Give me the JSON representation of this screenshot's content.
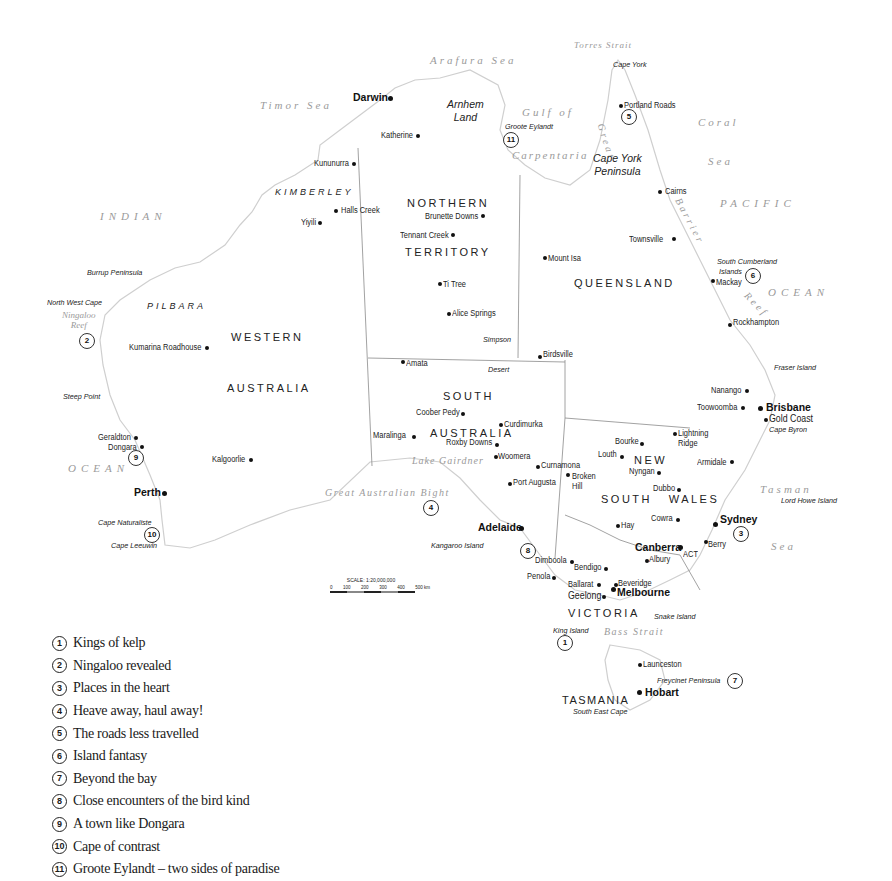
{
  "map": {
    "title": "Australia destinations map",
    "seas": [
      {
        "id": "timor-sea",
        "label": "Timor Sea",
        "x": 260,
        "y": 100
      },
      {
        "id": "arafura-sea",
        "label": "Arafura Sea",
        "x": 430,
        "y": 55
      },
      {
        "id": "torres-strait",
        "label": "Torres Strait",
        "x": 574,
        "y": 41
      },
      {
        "id": "gulf-of",
        "label": "Gulf of",
        "x": 522,
        "y": 107
      },
      {
        "id": "carpentaria",
        "label": "Carpentaria",
        "x": 512,
        "y": 150
      },
      {
        "id": "coral",
        "label": "Coral",
        "x": 698,
        "y": 117
      },
      {
        "id": "coral-sea",
        "label": "Sea",
        "x": 708,
        "y": 156
      },
      {
        "id": "pacific",
        "label": "PACIFIC",
        "x": 720,
        "y": 198
      },
      {
        "id": "ocean-east",
        "label": "OCEAN",
        "x": 768,
        "y": 287
      },
      {
        "id": "indian",
        "label": "INDIAN",
        "x": 100,
        "y": 211
      },
      {
        "id": "ocean-west",
        "label": "OCEAN",
        "x": 68,
        "y": 463
      },
      {
        "id": "great-australian-bight",
        "label": "Great Australian Bight",
        "x": 325,
        "y": 488
      },
      {
        "id": "lake-gairdner",
        "label": "Lake Gairdner",
        "x": 412,
        "y": 456
      },
      {
        "id": "tasman",
        "label": "Tasman",
        "x": 760,
        "y": 484
      },
      {
        "id": "tasman-sea",
        "label": "Sea",
        "x": 771,
        "y": 541
      },
      {
        "id": "bass-strait",
        "label": "Bass Strait",
        "x": 604,
        "y": 627
      },
      {
        "id": "ningaloo-reef",
        "label": "Ningaloo\nReef",
        "x": 62,
        "y": 311
      }
    ],
    "reef_label": {
      "great": "Great",
      "barrier": "Barrier",
      "reef": "Reef"
    },
    "states": [
      {
        "id": "northern-territory-1",
        "label": "NORTHERN",
        "x": 407,
        "y": 198
      },
      {
        "id": "northern-territory-2",
        "label": "TERRITORY",
        "x": 405,
        "y": 247
      },
      {
        "id": "queensland",
        "label": "QUEENSLAND",
        "x": 574,
        "y": 278
      },
      {
        "id": "western",
        "label": "WESTERN",
        "x": 231,
        "y": 332
      },
      {
        "id": "australia-wa",
        "label": "AUSTRALIA",
        "x": 227,
        "y": 383
      },
      {
        "id": "south",
        "label": "SOUTH",
        "x": 443,
        "y": 391
      },
      {
        "id": "australia-sa",
        "label": "AUSTRALIA",
        "x": 430,
        "y": 428
      },
      {
        "id": "new",
        "label": "NEW",
        "x": 634,
        "y": 455
      },
      {
        "id": "south-wales",
        "label": "SOUTH   WALES",
        "x": 601,
        "y": 494
      },
      {
        "id": "victoria",
        "label": "VICTORIA",
        "x": 568,
        "y": 608
      },
      {
        "id": "tasmania",
        "label": "TASMANIA",
        "x": 562,
        "y": 695
      },
      {
        "id": "act",
        "label": "ACT",
        "x": 683,
        "y": 550
      }
    ],
    "regions": [
      {
        "id": "kimberley",
        "label": "KIMBERLEY",
        "x": 275,
        "y": 188
      },
      {
        "id": "pilbara",
        "label": "PILBARA",
        "x": 147,
        "y": 302
      }
    ],
    "features": [
      {
        "id": "cape-york",
        "label": "Cape York",
        "x": 613,
        "y": 61
      },
      {
        "id": "groote-eylandt",
        "label": "Groote Eylandt",
        "x": 505,
        "y": 123
      },
      {
        "id": "south-cumberland-islands",
        "label": "South Cumberland",
        "x": 717,
        "y": 258
      },
      {
        "id": "islands",
        "label": "Islands",
        "x": 719,
        "y": 268
      },
      {
        "id": "burrup-peninsula",
        "label": "Burrup Peninsula",
        "x": 87,
        "y": 269
      },
      {
        "id": "north-west-cape",
        "label": "North West Cape",
        "x": 47,
        "y": 299
      },
      {
        "id": "simpson",
        "label": "Simpson",
        "x": 483,
        "y": 336
      },
      {
        "id": "desert",
        "label": "Desert",
        "x": 488,
        "y": 366
      },
      {
        "id": "steep-point",
        "label": "Steep Point",
        "x": 63,
        "y": 393
      },
      {
        "id": "fraser-island",
        "label": "Fraser Island",
        "x": 774,
        "y": 364
      },
      {
        "id": "cape-byron",
        "label": "Cape Byron",
        "x": 769,
        "y": 426
      },
      {
        "id": "lord-howe-island",
        "label": "Lord Howe Island",
        "x": 781,
        "y": 497
      },
      {
        "id": "cape-naturaliste",
        "label": "Cape Naturaliste",
        "x": 98,
        "y": 519
      },
      {
        "id": "cape-leeuwin",
        "label": "Cape Leeuwin",
        "x": 111,
        "y": 542
      },
      {
        "id": "kangaroo-island",
        "label": "Kangaroo Island",
        "x": 431,
        "y": 542
      },
      {
        "id": "snake-island",
        "label": "Snake Island",
        "x": 654,
        "y": 613
      },
      {
        "id": "king-island",
        "label": "King Island",
        "x": 553,
        "y": 627
      },
      {
        "id": "freycinet-peninsula",
        "label": "Freycinet Peninsula",
        "x": 657,
        "y": 677
      },
      {
        "id": "south-east-cape",
        "label": "South East Cape",
        "x": 573,
        "y": 708
      }
    ],
    "feature_big": [
      {
        "id": "arnhem-land",
        "label": "Arnhem\nLand",
        "x": 447,
        "y": 98
      },
      {
        "id": "cape-york-peninsula",
        "label": "Cape York\nPeninsula",
        "x": 593,
        "y": 152
      }
    ],
    "cities": [
      {
        "id": "darwin",
        "label": "Darwin",
        "x": 353,
        "y": 92,
        "dx": 390,
        "dy": 98
      },
      {
        "id": "perth",
        "label": "Perth",
        "x": 134,
        "y": 487,
        "dx": 164,
        "dy": 493
      },
      {
        "id": "adelaide",
        "label": "Adelaide",
        "x": 478,
        "y": 522,
        "dx": 521,
        "dy": 528
      },
      {
        "id": "brisbane",
        "label": "Brisbane",
        "x": 766,
        "y": 402,
        "dx": 760,
        "dy": 408
      },
      {
        "id": "sydney",
        "label": "Sydney",
        "x": 720,
        "y": 514,
        "dx": 715,
        "dy": 524
      },
      {
        "id": "canberra",
        "label": "Canberra",
        "x": 635,
        "y": 542,
        "dx": 680,
        "dy": 547
      },
      {
        "id": "melbourne",
        "label": "Melbourne",
        "x": 617,
        "y": 587,
        "dx": 613,
        "dy": 589
      },
      {
        "id": "hobart",
        "label": "Hobart",
        "x": 645,
        "y": 687,
        "dx": 639,
        "dy": 692
      }
    ],
    "towns": [
      {
        "id": "katherine",
        "label": "Katherine",
        "x": 381,
        "y": 131,
        "dx": 418,
        "dy": 136,
        "align": "r"
      },
      {
        "id": "portland-roads",
        "label": "Portland Roads",
        "x": 624,
        "y": 101,
        "dx": 621,
        "dy": 105,
        "align": "l"
      },
      {
        "id": "kununurra",
        "label": "Kununurra",
        "x": 314,
        "y": 159,
        "dx": 354,
        "dy": 164,
        "align": "r"
      },
      {
        "id": "cairns",
        "label": "Cairns",
        "x": 665,
        "y": 187,
        "dx": 660,
        "dy": 192,
        "align": "l"
      },
      {
        "id": "halls-creek",
        "label": "Halls Creek",
        "x": 341,
        "y": 206,
        "dx": 336,
        "dy": 211,
        "align": "l"
      },
      {
        "id": "brunette-downs",
        "label": "Brunette Downs",
        "x": 425,
        "y": 212,
        "dx": 483,
        "dy": 216,
        "align": "r"
      },
      {
        "id": "yiyili",
        "label": "Yiyili",
        "x": 301,
        "y": 218,
        "dx": 320,
        "dy": 223,
        "align": "r"
      },
      {
        "id": "tennant-creek",
        "label": "Tennant Creek",
        "x": 400,
        "y": 231,
        "dx": 453,
        "dy": 235,
        "align": "r"
      },
      {
        "id": "townsville",
        "label": "Townsville",
        "x": 629,
        "y": 235,
        "dx": 674,
        "dy": 239,
        "align": "r"
      },
      {
        "id": "mount-isa",
        "label": "Mount Isa",
        "x": 548,
        "y": 254,
        "dx": 545,
        "dy": 258,
        "align": "l"
      },
      {
        "id": "mackay",
        "label": "Mackay",
        "x": 716,
        "y": 278,
        "dx": 711,
        "dy": 280,
        "align": "l"
      },
      {
        "id": "ti-tree",
        "label": "Ti Tree",
        "x": 443,
        "y": 280,
        "dx": 440,
        "dy": 284,
        "align": "l"
      },
      {
        "id": "alice-springs",
        "label": "Alice Springs",
        "x": 452,
        "y": 309,
        "dx": 448,
        "dy": 313,
        "align": "l"
      },
      {
        "id": "rockhampton",
        "label": "Rockhampton",
        "x": 733,
        "y": 318,
        "dx": 729,
        "dy": 324,
        "align": "l"
      },
      {
        "id": "kumarina-roadhouse",
        "label": "Kumarina Roadhouse",
        "x": 129,
        "y": 343,
        "dx": 206,
        "dy": 347,
        "align": "r"
      },
      {
        "id": "birdsville",
        "label": "Birdsville",
        "x": 543,
        "y": 350,
        "dx": 539,
        "dy": 356,
        "align": "l"
      },
      {
        "id": "amata",
        "label": "Amata",
        "x": 406,
        "y": 359,
        "dx": 402,
        "dy": 361,
        "align": "l"
      },
      {
        "id": "nanango",
        "label": "Nanango",
        "x": 711,
        "y": 386,
        "dx": 746,
        "dy": 390,
        "align": "r"
      },
      {
        "id": "toowoomba",
        "label": "Toowoomba",
        "x": 697,
        "y": 403,
        "dx": 742,
        "dy": 407,
        "align": "r"
      },
      {
        "id": "gold-coast",
        "label": "Gold Coast",
        "x": 769,
        "y": 414,
        "dx": 765,
        "dy": 419,
        "align": "l"
      },
      {
        "id": "coober-pedy",
        "label": "Coober Pedy",
        "x": 416,
        "y": 408,
        "dx": 462,
        "dy": 413,
        "align": "r"
      },
      {
        "id": "curdimurka",
        "label": "Curdimurka",
        "x": 504,
        "y": 420,
        "dx": 500,
        "dy": 424,
        "align": "l"
      },
      {
        "id": "lightning-ridge",
        "label": "Lightning\nRidge",
        "x": 678,
        "y": 428,
        "dx": 674,
        "dy": 433,
        "align": "l"
      },
      {
        "id": "bourke",
        "label": "Bourke",
        "x": 615,
        "y": 437,
        "dx": 641,
        "dy": 443,
        "align": "r"
      },
      {
        "id": "maralinga",
        "label": "Maralinga",
        "x": 373,
        "y": 431,
        "dx": 413,
        "dy": 436,
        "align": "r"
      },
      {
        "id": "roxby-downs",
        "label": "Roxby Downs",
        "x": 446,
        "y": 438,
        "dx": 496,
        "dy": 444,
        "align": "r"
      },
      {
        "id": "louth",
        "label": "Louth",
        "x": 598,
        "y": 450,
        "dx": 621,
        "dy": 456,
        "align": "r"
      },
      {
        "id": "woomera",
        "label": "Woomera",
        "x": 498,
        "y": 452,
        "dx": 495,
        "dy": 456,
        "align": "l"
      },
      {
        "id": "kalgoorlie",
        "label": "Kalgoorlie",
        "x": 212,
        "y": 455,
        "dx": 250,
        "dy": 459,
        "align": "r"
      },
      {
        "id": "armidale",
        "label": "Armidale",
        "x": 697,
        "y": 458,
        "dx": 731,
        "dy": 461,
        "align": "r"
      },
      {
        "id": "geraldton",
        "label": "Geraldton",
        "x": 98,
        "y": 433,
        "dx": 135,
        "dy": 437,
        "align": "r"
      },
      {
        "id": "dongara",
        "label": "Dongara",
        "x": 108,
        "y": 443,
        "dx": 141,
        "dy": 446,
        "align": "r"
      },
      {
        "id": "nyngan",
        "label": "Nyngan",
        "x": 629,
        "y": 467,
        "dx": 658,
        "dy": 472,
        "align": "r"
      },
      {
        "id": "curnamona",
        "label": "Curnamona",
        "x": 541,
        "y": 461,
        "dx": 537,
        "dy": 466,
        "align": "l"
      },
      {
        "id": "broken-hill",
        "label": "Broken\nHill",
        "x": 572,
        "y": 471,
        "dx": 567,
        "dy": 474,
        "align": "l"
      },
      {
        "id": "port-augusta",
        "label": "Port Augusta",
        "x": 513,
        "y": 478,
        "dx": 509,
        "dy": 483,
        "align": "l"
      },
      {
        "id": "dubbo",
        "label": "Dubbo",
        "x": 653,
        "y": 484,
        "dx": 678,
        "dy": 489,
        "align": "r"
      },
      {
        "id": "cowra",
        "label": "Cowra",
        "x": 651,
        "y": 514,
        "dx": 677,
        "dy": 519,
        "align": "r"
      },
      {
        "id": "hay",
        "label": "Hay",
        "x": 621,
        "y": 521,
        "dx": 617,
        "dy": 525,
        "align": "l"
      },
      {
        "id": "berry",
        "label": "Berry",
        "x": 708,
        "y": 540,
        "dx": 704,
        "dy": 541,
        "align": "l"
      },
      {
        "id": "albury",
        "label": "Albury",
        "x": 649,
        "y": 555,
        "dx": 646,
        "dy": 560,
        "align": "l"
      },
      {
        "id": "dimboola",
        "label": "Dimboola",
        "x": 535,
        "y": 556,
        "dx": 571,
        "dy": 561,
        "align": "r"
      },
      {
        "id": "bendigo",
        "label": "Bendigo",
        "x": 574,
        "y": 563,
        "dx": 605,
        "dy": 568,
        "align": "r"
      },
      {
        "id": "penola",
        "label": "Penola",
        "x": 527,
        "y": 572,
        "dx": 553,
        "dy": 577,
        "align": "r"
      },
      {
        "id": "ballarat",
        "label": "Ballarat",
        "x": 568,
        "y": 580,
        "dx": 598,
        "dy": 584,
        "align": "r"
      },
      {
        "id": "beveridge",
        "label": "Beveridge",
        "x": 618,
        "y": 579,
        "dx": 615,
        "dy": 584,
        "align": "l"
      },
      {
        "id": "geelong",
        "label": "Geelong",
        "x": 568,
        "y": 591,
        "dx": 603,
        "dy": 596,
        "align": "r"
      },
      {
        "id": "launceston",
        "label": "Launceston",
        "x": 643,
        "y": 660,
        "dx": 639,
        "dy": 664,
        "align": "l"
      }
    ],
    "markers": [
      {
        "id": "marker-1",
        "num": "1",
        "x": 564,
        "y": 635
      },
      {
        "id": "marker-2",
        "num": "2",
        "x": 79,
        "y": 333
      },
      {
        "id": "marker-3",
        "num": "3",
        "x": 733,
        "y": 526
      },
      {
        "id": "marker-4",
        "num": "4",
        "x": 423,
        "y": 500
      },
      {
        "id": "marker-5",
        "num": "5",
        "x": 621,
        "y": 109
      },
      {
        "id": "marker-6",
        "num": "6",
        "x": 745,
        "y": 268
      },
      {
        "id": "marker-7",
        "num": "7",
        "x": 727,
        "y": 673
      },
      {
        "id": "marker-8",
        "num": "8",
        "x": 520,
        "y": 543
      },
      {
        "id": "marker-9",
        "num": "9",
        "x": 128,
        "y": 450
      },
      {
        "id": "marker-10",
        "num": "10",
        "x": 145,
        "y": 527
      },
      {
        "id": "marker-11",
        "num": "11",
        "x": 503,
        "y": 132
      }
    ],
    "scale": {
      "title": "SCALE: 1:20,000,000",
      "ticks": [
        "0",
        "100",
        "200",
        "300",
        "400",
        "500 km"
      ]
    }
  },
  "legend": {
    "items": [
      {
        "num": "1",
        "label": "Kings of kelp"
      },
      {
        "num": "2",
        "label": "Ningaloo revealed"
      },
      {
        "num": "3",
        "label": "Places in the heart"
      },
      {
        "num": "4",
        "label": "Heave away, haul away!"
      },
      {
        "num": "5",
        "label": "The roads less travelled"
      },
      {
        "num": "6",
        "label": "Island fantasy"
      },
      {
        "num": "7",
        "label": "Beyond the bay"
      },
      {
        "num": "8",
        "label": "Close encounters of the bird kind"
      },
      {
        "num": "9",
        "label": "A town like Dongara"
      },
      {
        "num": "10",
        "label": "Cape of contrast"
      },
      {
        "num": "11",
        "label": "Groote Eylandt – two sides of paradise"
      }
    ]
  },
  "colors": {
    "coast": "#cfcfcf",
    "border": "#8a8a8a",
    "text": "#1a1a1a",
    "sea_text": "#9a9a9a"
  }
}
